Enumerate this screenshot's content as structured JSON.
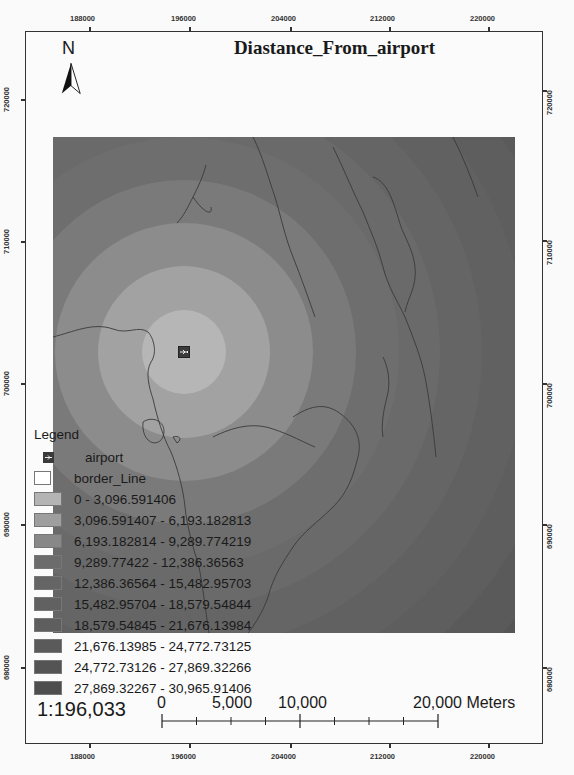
{
  "map": {
    "title": "Diastance_From_airport",
    "north_label": "N",
    "scale_ratio": "1:196,033",
    "x_axis_ticks": [
      "188000",
      "196000",
      "204000",
      "212000",
      "220000"
    ],
    "y_axis_ticks": [
      "720000",
      "710000",
      "700000",
      "690000",
      "680000"
    ],
    "scale_bar": {
      "labels": [
        "0",
        "5,000",
        "10,000",
        "20,000 Meters"
      ]
    },
    "airport_icon": "airplane-icon"
  },
  "legend": {
    "title": "Legend",
    "items": [
      {
        "label": "airport",
        "color": "#3a3a3a",
        "type": "point"
      },
      {
        "label": "border_Line",
        "color": "#ffffff",
        "type": "line"
      },
      {
        "label": "0 - 3,096.591406",
        "color": "#b4b4b4"
      },
      {
        "label": "3,096.591407 - 6,193.182813",
        "color": "#9e9e9e"
      },
      {
        "label": "6,193.182814 - 9,289.774219",
        "color": "#888888"
      },
      {
        "label": "9,289.77422 - 12,386.36563",
        "color": "#6c6c6c"
      },
      {
        "label": "12,386.36564 - 15,482.95703",
        "color": "#656565"
      },
      {
        "label": "15,482.95704 - 18,579.54844",
        "color": "#616161"
      },
      {
        "label": "18,579.54845 - 21,676.13984",
        "color": "#5e5e5e"
      },
      {
        "label": "21,676.13985 - 24,772.73125",
        "color": "#5a5a5a"
      },
      {
        "label": "24,772.73126 - 27,869.32266",
        "color": "#545454"
      },
      {
        "label": "27,869.32267 - 30,965.91406",
        "color": "#4e4e4e"
      }
    ]
  }
}
